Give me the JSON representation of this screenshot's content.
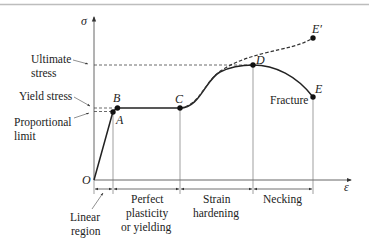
{
  "diagram": {
    "axes": {
      "y_label": "σ",
      "x_label": "ε",
      "origin_label": "O"
    },
    "points": {
      "A": "A",
      "B": "B",
      "C": "C",
      "D": "D",
      "E": "E",
      "E_prime": "E′"
    },
    "stress_labels": {
      "ultimate_line1": "Ultimate",
      "ultimate_line2": "stress",
      "yield": "Yield stress",
      "proportional_line1": "Proportional",
      "proportional_line2": "limit"
    },
    "fracture_label": "Fracture",
    "regions": {
      "linear_line1": "Linear",
      "linear_line2": "region",
      "perfect_line1": "Perfect",
      "perfect_line2": "plasticity",
      "perfect_line3": "or yielding",
      "strain_line1": "Strain",
      "strain_line2": "hardening",
      "necking": "Necking"
    },
    "colors": {
      "ink": "#222222",
      "thin_line": "#555555",
      "top_rule": "#bbbbbb"
    }
  }
}
